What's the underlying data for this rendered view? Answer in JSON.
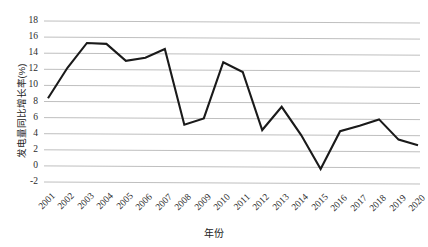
{
  "chart_data": {
    "type": "line",
    "title": "",
    "subtitle": "",
    "xlabel": "年份",
    "ylabel": "发电量同比增长率(%)",
    "categories": [
      "2001",
      "2002",
      "2003",
      "2004",
      "2005",
      "2006",
      "2007",
      "2008",
      "2009",
      "2010",
      "2011",
      "2012",
      "2013",
      "2014",
      "2015",
      "2016",
      "2017",
      "2018",
      "2019",
      "2020"
    ],
    "series": [
      {
        "name": "发电量同比增长率",
        "values": [
          8.4,
          12.2,
          15.3,
          15.2,
          13.1,
          13.5,
          14.6,
          5.2,
          6.0,
          13.0,
          11.8,
          4.6,
          7.5,
          4.0,
          -0.2,
          4.5,
          5.2,
          6.0,
          3.5,
          2.8
        ],
        "color": "#1a1a1a"
      }
    ],
    "xticklabels": [
      "2001",
      "2002",
      "2003",
      "2004",
      "2005",
      "2006",
      "2007",
      "2008",
      "2009",
      "2010",
      "2011",
      "2012",
      "2013",
      "2014",
      "2015",
      "2016",
      "2017",
      "2018",
      "2019",
      "2020"
    ],
    "yticklabels": [
      "18",
      "16",
      "14",
      "12",
      "10",
      "8",
      "6",
      "4",
      "2",
      "0",
      "-2"
    ],
    "yticks": [
      18,
      16,
      14,
      12,
      10,
      8,
      6,
      4,
      2,
      0,
      -2
    ],
    "ylim": [
      -2,
      18
    ],
    "grid": "horizontal",
    "legend": "none",
    "gridline_color": "#bfbfbf",
    "plot_background": "#ffffff",
    "line_width_px": 2.1
  },
  "axis": {
    "y_title": "发电量同比增长率(%)",
    "x_title": "年份"
  }
}
